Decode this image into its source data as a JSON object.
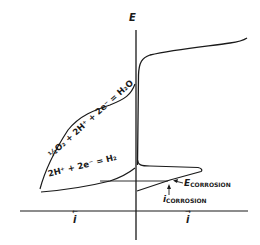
{
  "diagram": {
    "axes": {
      "vertical_label": "E",
      "horizontal_left_label": "i",
      "horizontal_right_label": "i",
      "horizontal_left_arrow": "←",
      "horizontal_right_arrow": "→"
    },
    "reactions": {
      "oxygen_reduction": "½O₂ + 2H⁺ + 2e⁻ = H₂O",
      "hydrogen_evolution": "2H⁺ + 2e⁻ = H₂"
    },
    "annotations": {
      "e_corrosion_main": "E",
      "e_corrosion_sub": "CORROSION",
      "i_corrosion_main": "i",
      "i_corrosion_sub": "CORROSION"
    },
    "colors": {
      "line": "#1a1a1a",
      "background": "#ffffff"
    }
  }
}
